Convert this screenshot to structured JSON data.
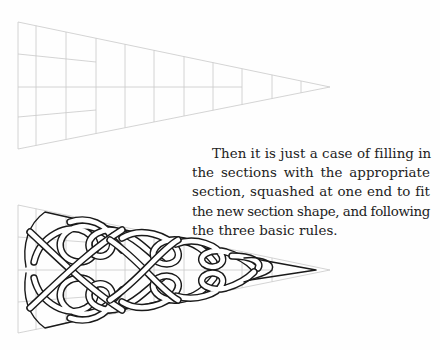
{
  "page": {
    "background": "#fefefe",
    "text_color": "#222222",
    "grid_color": "#c9c9c9",
    "knot_color": "#1a1a1a"
  },
  "caption": {
    "paragraph": "Then it is just a case of filling in the sections with the appropriate section, squashed at one end to fit the new section shape, and following the three basic rules.",
    "lines": [
      "Then it is just a case of filling in",
      "the sections with the appropriate",
      "section, squashed at one end to fit",
      "the new section shape, and following",
      "the three basic rules."
    ]
  },
  "figures": {
    "grid_triangle": {
      "label": "empty tapered grid",
      "left_x": 18,
      "top_y": 22,
      "bottom_y": 149,
      "apex": [
        330,
        87
      ],
      "vertical_lines_x": [
        36,
        66,
        96,
        125,
        154,
        184,
        213,
        242,
        272,
        301
      ],
      "partial_horizontal_rows": 2,
      "center_line_to_x": 242
    },
    "knot_triangle": {
      "label": "tapered grid filled with celtic knotwork",
      "left_x": 18,
      "top_y": 205,
      "bottom_y": 333,
      "apex": [
        330,
        270
      ],
      "knot_tip": [
        316,
        270
      ]
    }
  }
}
